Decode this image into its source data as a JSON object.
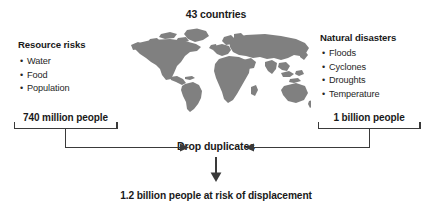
{
  "diagram": {
    "title": "43 countries",
    "left_group": {
      "heading": "Resource risks",
      "bullets": [
        "Water",
        "Food",
        "Population"
      ],
      "total": "740 million people"
    },
    "right_group": {
      "heading": "Natural disasters",
      "bullets": [
        "Floods",
        "Cyclones",
        "Droughts",
        "Temperature"
      ],
      "total": "1 billion people"
    },
    "merge_step": "Drop duplicates",
    "result": "1.2 billion people at risk of displacement",
    "map": {
      "icon": "world-map-silhouette",
      "fill_color": "#808080"
    },
    "colors": {
      "text": "#1a1a1a",
      "body_text": "#262626",
      "connector": "#3a3a3a",
      "background": "#ffffff"
    }
  }
}
